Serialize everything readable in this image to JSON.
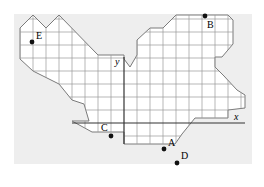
{
  "diagram": {
    "type": "coordinate-grid-puzzle",
    "axes": {
      "x_label": "x",
      "y_label": "y"
    },
    "points": [
      {
        "label": "A",
        "x": 3,
        "y": -2
      },
      {
        "label": "B",
        "x": 6,
        "y": 10
      },
      {
        "label": "C",
        "x": -1,
        "y": -1
      },
      {
        "label": "D",
        "x": 3,
        "y": -3
      },
      {
        "label": "E",
        "x": -7,
        "y": 8
      }
    ],
    "colors": {
      "background": "#eeeeee",
      "grid": "#8a8a8a",
      "axis": "#333333",
      "point": "#111111"
    }
  }
}
